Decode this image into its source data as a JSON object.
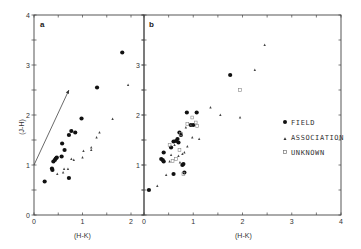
{
  "chart_data": [
    {
      "type": "scatter",
      "panel": "a",
      "xlabel": "(H-K)",
      "ylabel": "(J-H)",
      "xlim": [
        0,
        2.27
      ],
      "ylim": [
        0,
        4
      ],
      "x_ticks": [
        0,
        1,
        2
      ],
      "y_ticks": [
        0,
        1,
        2,
        3,
        4
      ],
      "grid": false,
      "annotations": [
        {
          "type": "arrow",
          "from": [
            0,
            1.0
          ],
          "to": [
            0.72,
            2.5
          ],
          "label": "reddening vector"
        }
      ],
      "series": [
        {
          "name": "FIELD",
          "marker": "filled-circle",
          "points": [
            [
              0.22,
              0.67
            ],
            [
              0.37,
              0.93
            ],
            [
              0.38,
              0.9
            ],
            [
              0.4,
              1.07
            ],
            [
              0.43,
              1.1
            ],
            [
              0.45,
              1.13
            ],
            [
              0.47,
              1.15
            ],
            [
              0.57,
              1.17
            ],
            [
              0.58,
              1.43
            ],
            [
              0.63,
              1.3
            ],
            [
              0.72,
              0.74
            ],
            [
              0.72,
              1.6
            ],
            [
              0.77,
              1.68
            ],
            [
              0.85,
              1.65
            ],
            [
              0.98,
              1.93
            ],
            [
              1.3,
              2.55
            ],
            [
              1.82,
              3.25
            ]
          ]
        },
        {
          "name": "ASSOCIATION",
          "marker": "small-triangle",
          "points": [
            [
              0.48,
              0.82
            ],
            [
              0.6,
              0.85
            ],
            [
              0.62,
              0.92
            ],
            [
              0.7,
              0.92
            ],
            [
              0.77,
              1.12
            ],
            [
              0.82,
              1.1
            ],
            [
              1.0,
              1.15
            ],
            [
              1.02,
              1.28
            ],
            [
              1.18,
              1.35
            ],
            [
              1.18,
              1.3
            ],
            [
              1.29,
              1.55
            ],
            [
              1.35,
              1.65
            ],
            [
              1.62,
              1.92
            ],
            [
              1.94,
              2.6
            ]
          ]
        }
      ]
    },
    {
      "type": "scatter",
      "panel": "b",
      "xlabel": "(H-K)",
      "ylabel": "",
      "xlim": [
        0,
        4
      ],
      "ylim": [
        0,
        4
      ],
      "x_ticks": [
        0,
        1,
        2,
        3,
        4
      ],
      "y_ticks": [
        0,
        1,
        2,
        3,
        4
      ],
      "grid": false,
      "legend": {
        "position": "right-middle",
        "entries": [
          "FIELD",
          "ASSOCIATION",
          "UNKNOWN"
        ]
      },
      "series": [
        {
          "name": "FIELD",
          "marker": "filled-circle",
          "points": [
            [
              0.1,
              0.5
            ],
            [
              0.35,
              1.12
            ],
            [
              0.38,
              1.1
            ],
            [
              0.4,
              1.07
            ],
            [
              0.4,
              1.25
            ],
            [
              0.55,
              1.35
            ],
            [
              0.6,
              0.82
            ],
            [
              0.6,
              1.47
            ],
            [
              0.65,
              1.48
            ],
            [
              0.68,
              1.52
            ],
            [
              0.7,
              1.45
            ],
            [
              0.72,
              1.65
            ],
            [
              0.75,
              1.6
            ],
            [
              0.78,
              1.0
            ],
            [
              0.8,
              1.02
            ],
            [
              0.82,
              0.85
            ],
            [
              0.87,
              2.05
            ],
            [
              0.95,
              1.8
            ],
            [
              1.0,
              1.8
            ],
            [
              1.07,
              2.05
            ],
            [
              1.75,
              2.8
            ]
          ]
        },
        {
          "name": "ASSOCIATION",
          "marker": "small-triangle",
          "points": [
            [
              0.27,
              0.58
            ],
            [
              0.45,
              0.8
            ],
            [
              0.52,
              1.07
            ],
            [
              0.55,
              1.2
            ],
            [
              0.62,
              1.4
            ],
            [
              0.7,
              1.18
            ],
            [
              0.73,
              1.05
            ],
            [
              0.78,
              1.22
            ],
            [
              0.82,
              1.25
            ],
            [
              0.85,
              1.75
            ],
            [
              0.88,
              1.37
            ],
            [
              0.95,
              1.8
            ],
            [
              0.98,
              1.55
            ],
            [
              1.12,
              1.52
            ],
            [
              1.35,
              2.15
            ],
            [
              1.55,
              2.0
            ],
            [
              1.95,
              1.95
            ],
            [
              2.25,
              2.9
            ],
            [
              2.45,
              3.4
            ]
          ]
        },
        {
          "name": "UNKNOWN",
          "marker": "open-square",
          "points": [
            [
              0.52,
              1.4
            ],
            [
              0.58,
              1.08
            ],
            [
              0.65,
              1.12
            ],
            [
              0.72,
              1.3
            ],
            [
              0.75,
              1.62
            ],
            [
              0.8,
              0.82
            ],
            [
              0.88,
              1.82
            ],
            [
              0.98,
              1.95
            ],
            [
              1.05,
              1.85
            ],
            [
              1.08,
              1.78
            ],
            [
              1.95,
              2.5
            ]
          ]
        }
      ]
    }
  ],
  "panels": {
    "a": {
      "label": "a",
      "x_title": "(H-K)",
      "y_title": "(J-H)"
    },
    "b": {
      "label": "b",
      "x_title": "(H-K)"
    }
  },
  "legend": {
    "field": "FIELD",
    "association": "ASSOCIATION",
    "unknown": "UNKNOWN"
  }
}
